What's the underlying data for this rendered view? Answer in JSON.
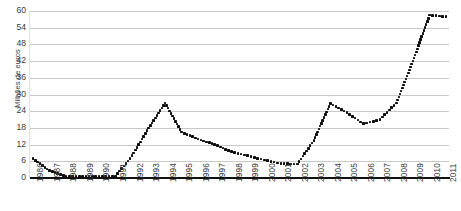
{
  "chart_data": {
    "type": "line",
    "title": "",
    "subtitle": "",
    "xlabel": "",
    "ylabel": "Milhões de euros",
    "ylim": [
      0,
      60
    ],
    "yticks": [
      0,
      6,
      12,
      18,
      24,
      30,
      36,
      42,
      48,
      54,
      60
    ],
    "grid": true,
    "legend": "none",
    "marker": "dotted-square",
    "series_color": "#0d0d0d",
    "grid_color": "#c9c9c9",
    "categories": [
      "1986",
      "1987",
      "1988",
      "1989",
      "1990",
      "1991",
      "1992",
      "1993",
      "1994",
      "1995",
      "1996",
      "1997",
      "1998",
      "1999",
      "2000",
      "2001",
      "2002",
      "2003",
      "2004",
      "2005",
      "2006",
      "2007",
      "2008",
      "2009",
      "2010",
      "2011"
    ],
    "values": [
      7.0,
      2.6,
      0.6,
      0.6,
      0.6,
      0.6,
      8.0,
      18.0,
      27.0,
      16.5,
      14.0,
      12.0,
      9.5,
      8.0,
      6.5,
      5.2,
      5.0,
      13.5,
      26.8,
      23.5,
      19.5,
      21.0,
      27.0,
      42.0,
      58.5,
      58.0
    ],
    "x_range": [
      "1986",
      "2011"
    ]
  }
}
